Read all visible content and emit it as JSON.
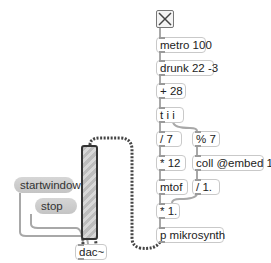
{
  "patch": {
    "objects": {
      "metro": "metro 100",
      "drunk": "drunk 22 -3",
      "plus": "+ 28",
      "trigger": "t i i",
      "div7": "/ 7",
      "mod7": "% 7",
      "mul12": "* 12",
      "coll": "coll @embed 1",
      "mtof": "mtof",
      "div1": "/ 1.",
      "mul1": "* 1.",
      "synth": "p mikrosynth",
      "dac": "dac~"
    },
    "messages": {
      "startwindow": "startwindow",
      "stop": "stop"
    },
    "toggle": {
      "state": "on",
      "icon": "x-mark"
    },
    "gain": {
      "type": "gain~ slider"
    }
  },
  "colors": {
    "cord_control": "#9a9a9a",
    "cord_signal": "#555555",
    "message_bg": "#cccccc",
    "object_border": "#c9c9c9"
  }
}
